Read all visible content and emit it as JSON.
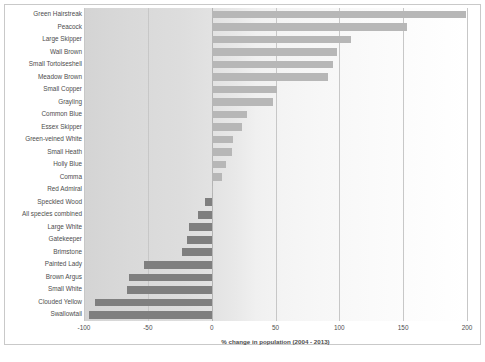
{
  "chart_data": {
    "type": "bar",
    "orientation": "horizontal",
    "title": "",
    "xlabel": "% change in population (2004 - 2013)",
    "ylabel": "",
    "xlim": [
      -100,
      200
    ],
    "xticks": [
      -100,
      -50,
      0,
      50,
      100,
      150,
      200
    ],
    "xtick_labels": [
      "-100",
      "-50",
      "0",
      "50",
      "100",
      "150",
      "200"
    ],
    "grid": true,
    "legend": "none",
    "positive_color": "#b7b7b7",
    "negative_color": "#7f7f7f",
    "categories": [
      "Green Hairstreak",
      "Peacock",
      "Large Skipper",
      "Wall Brown",
      "Small Tortoiseshell",
      "Meadow Brown",
      "Small Copper",
      "Grayling",
      "Common Blue",
      "Essex Skipper",
      "Green-veined White",
      "Small Heath",
      "Holly Blue",
      "Comma",
      "Red Admiral",
      "Speckled Wood",
      "All species combined",
      "Large White",
      "Gatekeeper",
      "Brimstone",
      "Painted Lady",
      "Brown Argus",
      "Small White",
      "Clouded Yellow",
      "Swallowtail"
    ],
    "values": [
      199,
      153,
      109,
      98,
      95,
      91,
      51,
      48,
      28,
      24,
      17,
      16,
      11,
      8,
      1,
      -5,
      -11,
      -18,
      -19,
      -23,
      -53,
      -65,
      -66,
      -91,
      -96
    ]
  }
}
